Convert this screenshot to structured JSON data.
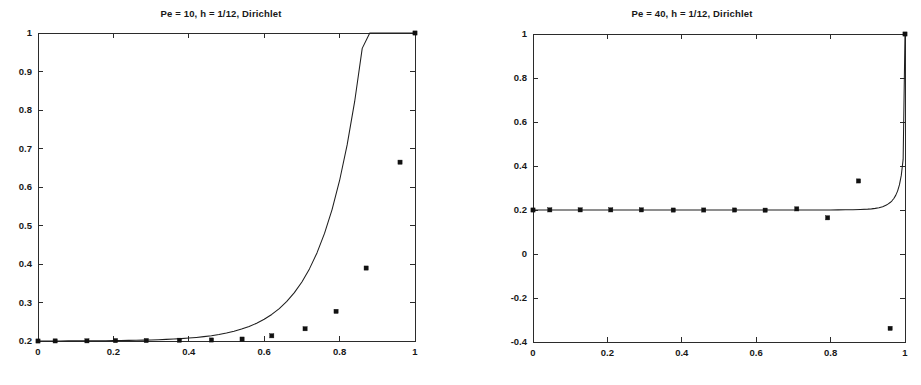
{
  "figure": {
    "background_color": "#ffffff",
    "line_color": "#1e1e1e",
    "marker_color": "#111111",
    "axis_color": "#2b2b2b"
  },
  "panels": [
    {
      "id": "panel-pe10",
      "title": "Pe = 10, h = 1/12, Dirichlet"
    },
    {
      "id": "panel-pe40",
      "title": "Pe = 40, h = 1/12, Dirichlet"
    }
  ],
  "chart_data": [
    {
      "type": "line",
      "title": "Pe = 10, h = 1/12, Dirichlet",
      "xlabel": "",
      "ylabel": "",
      "xlim": [
        0,
        1
      ],
      "ylim": [
        0.2,
        1
      ],
      "grid": false,
      "legend": "none",
      "xticks": [
        0,
        0.2,
        0.4,
        0.6,
        0.8,
        1
      ],
      "xticklabels": [
        "0",
        "0.2",
        "0.4",
        "0.6",
        "0.8",
        "1"
      ],
      "yticks": [
        0.2,
        0.3,
        0.4,
        0.5,
        0.6,
        0.7,
        0.8,
        0.9,
        1
      ],
      "yticklabels": [
        "0.2",
        "0.3",
        "0.4",
        "0.5",
        "0.6",
        "0.7",
        "0.8",
        "0.9",
        "1"
      ],
      "series": [
        {
          "name": "exact solution",
          "style": "line",
          "x": [
            0,
            0.02,
            0.04,
            0.06,
            0.08,
            0.1,
            0.12,
            0.14,
            0.16,
            0.18,
            0.2,
            0.22,
            0.24,
            0.26,
            0.28,
            0.3,
            0.32,
            0.34,
            0.36,
            0.38,
            0.4,
            0.42,
            0.44,
            0.46,
            0.48,
            0.5,
            0.52,
            0.54,
            0.56,
            0.58,
            0.6,
            0.62,
            0.64,
            0.66,
            0.68,
            0.7,
            0.72,
            0.74,
            0.76,
            0.78,
            0.8,
            0.82,
            0.84,
            0.86,
            0.88,
            0.9,
            0.92,
            0.94,
            0.96,
            0.98,
            1
          ],
          "y": [
            0.2,
            0.2001,
            0.2001,
            0.2002,
            0.2003,
            0.2004,
            0.2005,
            0.2006,
            0.2007,
            0.2009,
            0.2011,
            0.2013,
            0.2016,
            0.2019,
            0.2023,
            0.2028,
            0.2034,
            0.2042,
            0.2051,
            0.2062,
            0.2076,
            0.2093,
            0.2114,
            0.2139,
            0.217,
            0.2208,
            0.2254,
            0.231,
            0.2379,
            0.2463,
            0.2565,
            0.269,
            0.2843,
            0.3029,
            0.3256,
            0.3534,
            0.3873,
            0.4288,
            0.4794,
            0.5413,
            0.6169,
            0.7093,
            0.8222,
            0.9601,
            1.0,
            1.0,
            1.0,
            1.0,
            1.0,
            1.0,
            1.0
          ]
        },
        {
          "name": "numerical solution",
          "style": "markers",
          "marker": "square",
          "x": [
            0.0,
            0.0455,
            0.1298,
            0.2056,
            0.2871,
            0.3751,
            0.4601,
            0.5413,
            0.6201,
            0.7084,
            0.7906,
            0.8704,
            0.9603,
            1.0
          ],
          "y": [
            0.2,
            0.2002,
            0.2004,
            0.201,
            0.2012,
            0.202,
            0.2026,
            0.205,
            0.2135,
            0.2318,
            0.277,
            0.3895,
            0.6645,
            1.0
          ]
        }
      ]
    },
    {
      "type": "line",
      "title": "Pe = 40, h = 1/12, Dirichlet",
      "xlabel": "",
      "ylabel": "",
      "xlim": [
        0,
        1
      ],
      "ylim": [
        -0.4,
        1
      ],
      "grid": false,
      "legend": "none",
      "xticks": [
        0,
        0.2,
        0.4,
        0.6,
        0.8,
        1
      ],
      "xticklabels": [
        "0",
        "0.2",
        "0.4",
        "0.6",
        "0.8",
        "1"
      ],
      "yticks": [
        -0.4,
        -0.2,
        0,
        0.2,
        0.4,
        0.6,
        0.8,
        1
      ],
      "yticklabels": [
        "-0.4",
        "-0.2",
        "0",
        "0.2",
        "0.4",
        "0.6",
        "0.8",
        "1"
      ],
      "series": [
        {
          "name": "exact solution",
          "style": "line",
          "x": [
            0,
            0.05,
            0.1,
            0.15,
            0.2,
            0.25,
            0.3,
            0.35,
            0.4,
            0.45,
            0.5,
            0.55,
            0.6,
            0.65,
            0.7,
            0.72,
            0.74,
            0.76,
            0.78,
            0.8,
            0.82,
            0.84,
            0.86,
            0.88,
            0.9,
            0.91,
            0.92,
            0.93,
            0.94,
            0.95,
            0.955,
            0.96,
            0.965,
            0.97,
            0.975,
            0.98,
            0.985,
            0.99,
            0.995,
            1
          ],
          "y": [
            0.2,
            0.2,
            0.2,
            0.2,
            0.2,
            0.2,
            0.2,
            0.2,
            0.2,
            0.2,
            0.2,
            0.2,
            0.2,
            0.2,
            0.2001,
            0.2001,
            0.2002,
            0.2002,
            0.2003,
            0.2004,
            0.2006,
            0.201,
            0.2015,
            0.2024,
            0.2039,
            0.2052,
            0.2073,
            0.2104,
            0.2152,
            0.2226,
            0.2277,
            0.234,
            0.242,
            0.2524,
            0.2664,
            0.2858,
            0.314,
            0.3573,
            0.43,
            1.0
          ]
        },
        {
          "name": "numerical solution",
          "style": "markers",
          "marker": "square",
          "x": [
            0.0,
            0.0452,
            0.1268,
            0.209,
            0.2913,
            0.377,
            0.4589,
            0.5418,
            0.624,
            0.709,
            0.792,
            0.875,
            0.96,
            1.0
          ],
          "y": [
            0.2,
            0.2005,
            0.2005,
            0.2005,
            0.2005,
            0.1998,
            0.2,
            0.2,
            0.1993,
            0.205,
            0.1645,
            0.332,
            -0.338,
            1.0
          ]
        }
      ]
    }
  ]
}
